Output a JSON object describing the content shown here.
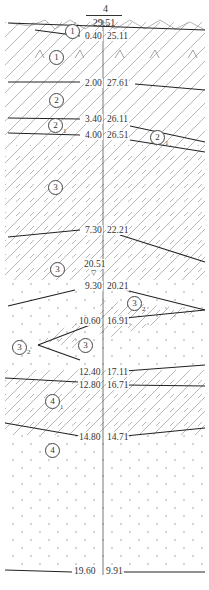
{
  "borehole": {
    "id": "4",
    "surface_elevation": "29.51"
  },
  "layer_boundaries": [
    {
      "depth": "0.40",
      "elevation": "25.11"
    },
    {
      "depth": "2.00",
      "elevation": "27.61"
    },
    {
      "depth": "3.40",
      "elevation": "26.11"
    },
    {
      "depth": "4.00",
      "elevation": "26.51"
    },
    {
      "depth": "7.30",
      "elevation": "22.21"
    },
    {
      "depth": "9.30",
      "elevation": "20.21"
    },
    {
      "depth": "10.60",
      "elevation": "16.91"
    },
    {
      "depth": "12.40",
      "elevation": "17.11"
    },
    {
      "depth": "12.80",
      "elevation": "16.71"
    },
    {
      "depth": "14.80",
      "elevation": "14.71"
    },
    {
      "depth": "19.60",
      "elevation": "9.91"
    }
  ],
  "water_level": {
    "elevation": "20.51",
    "symbol": "▽"
  },
  "layer_labels": [
    {
      "num": "1",
      "sub": ""
    },
    {
      "num": "1",
      "sub": ""
    },
    {
      "num": "2",
      "sub": ""
    },
    {
      "num": "2",
      "sub": "1"
    },
    {
      "num": "2",
      "sub": "1"
    },
    {
      "num": "3",
      "sub": ""
    },
    {
      "num": "3",
      "sub": ""
    },
    {
      "num": "3",
      "sub": "2"
    },
    {
      "num": "3",
      "sub": "2"
    },
    {
      "num": "3",
      "sub": ""
    },
    {
      "num": "4",
      "sub": "1"
    },
    {
      "num": "4",
      "sub": ""
    }
  ],
  "colors": {
    "line": "#222222",
    "hatch": "#9a9a9a",
    "text": "#333333"
  }
}
